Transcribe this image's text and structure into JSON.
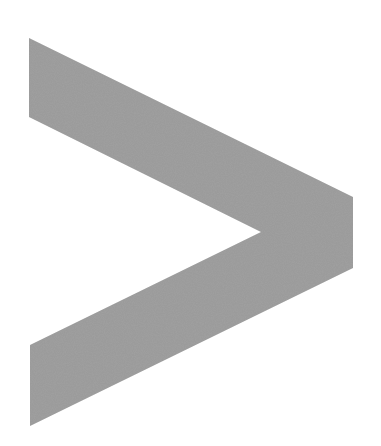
{
  "icon": {
    "name": "chevron-right",
    "label": "Next",
    "fill_color": "#9a9a9a",
    "background_color": "#ffffff",
    "points": "29,38 353,197 353,268 30,426 30,345 261,232 29,117"
  }
}
